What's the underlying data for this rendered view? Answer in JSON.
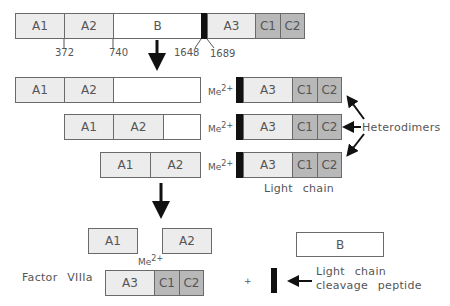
{
  "precursor": {
    "domains": [
      "A1",
      "A2",
      "B",
      "A3",
      "C1",
      "C2"
    ],
    "positions": [
      "372",
      "740",
      "1648",
      "1689"
    ]
  },
  "intermediates": {
    "rows": [
      {
        "heavy": [
          "A1",
          "A2",
          ""
        ],
        "metal": "Me",
        "charge": "2+",
        "light": [
          "A3",
          "C1",
          "C2"
        ]
      },
      {
        "heavy": [
          "A1",
          "A2",
          ""
        ],
        "metal": "Me",
        "charge": "2+",
        "light": [
          "A3",
          "C1",
          "C2"
        ]
      },
      {
        "heavy": [
          "A1",
          "A2"
        ],
        "metal": "Me",
        "charge": "2+",
        "light": [
          "A3",
          "C1",
          "C2"
        ]
      }
    ],
    "heterodimers_label": "Heterodimers",
    "light_chain_label": "Light chain"
  },
  "product": {
    "label": "Factor VIIIa",
    "a1": "A1",
    "a2": "A2",
    "metal": "Me",
    "charge": "2+",
    "light": [
      "A3",
      "C1",
      "C2"
    ],
    "plus": "+",
    "b_domain": "B",
    "peptide_label_line1": "Light chain",
    "peptide_label_line2": "cleavage peptide"
  },
  "colors": {
    "heavy_fill": "#ececec",
    "c_domain_fill": "#b8b8b8",
    "acidic_region": "#111111",
    "outline": "#6a6a6a"
  }
}
